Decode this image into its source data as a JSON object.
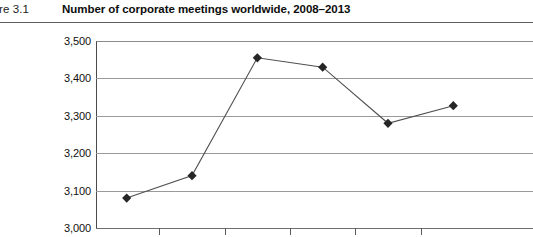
{
  "figure": {
    "number_label": "gure 3.1",
    "title": "Number of corporate meetings worldwide, 2008–2013"
  },
  "chart_data": {
    "type": "line",
    "title": "Number of corporate meetings worldwide, 2008–2013",
    "xlabel": "",
    "ylabel": "",
    "categories": [
      "2008",
      "2009",
      "2010",
      "2011",
      "2012",
      "2013"
    ],
    "values": [
      3080,
      3140,
      3455,
      3430,
      3280,
      3327
    ],
    "ylim": [
      3000,
      3500
    ],
    "ytick_labels": [
      "3,500",
      "3,400",
      "3,300",
      "3,200",
      "3,100",
      "3,000"
    ],
    "ytick_values": [
      3500,
      3400,
      3300,
      3200,
      3100,
      3000
    ],
    "grid": true,
    "legend": "none",
    "marker": "diamond",
    "line_color": "#4f4f4f",
    "marker_color": "#262626",
    "grid_color": "#9a9a9a",
    "axis_color": "#4a4a4a"
  }
}
